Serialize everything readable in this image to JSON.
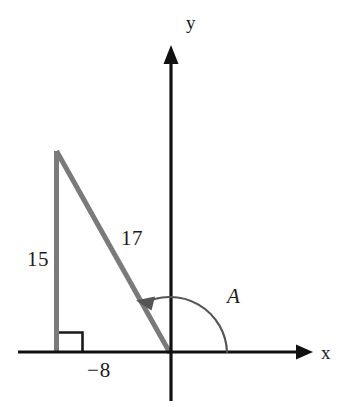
{
  "figure": {
    "type": "geometry-diagram",
    "colors": {
      "axis": "#111111",
      "triangle": "#7a7a7a",
      "arc": "#555555",
      "text": "#1a1a1a",
      "background": "#ffffff"
    },
    "axes": {
      "x_label": "x",
      "y_label": "y",
      "origin": {
        "x": 170,
        "y": 352
      },
      "x_axis": {
        "start_x": 18,
        "end_x": 312,
        "y": 352,
        "arrow": "right"
      },
      "y_axis": {
        "x": 171,
        "start_y": 45,
        "end_y": 401,
        "arrow": "up"
      }
    },
    "triangle": {
      "vertices": {
        "origin": {
          "x": 170,
          "y": 352
        },
        "foot": {
          "x": 56,
          "y": 352
        },
        "apex": {
          "x": 56,
          "y": 150
        }
      },
      "right_angle_marker": true,
      "labels": {
        "opposite": "15",
        "hypotenuse": "17",
        "adjacent": "−8"
      }
    },
    "angle": {
      "label": "A",
      "arc_radius": 57,
      "start_deg": 0,
      "end_deg": 118,
      "direction": "counterclockwise",
      "arrowhead": "at-terminal-side"
    }
  }
}
